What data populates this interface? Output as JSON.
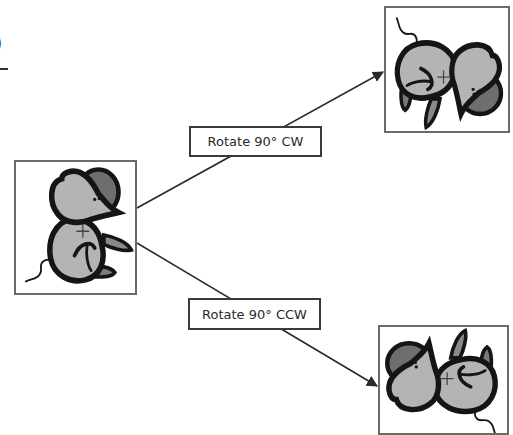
{
  "figure": {
    "type": "rotation-diagram",
    "cropped_fragment": {
      "text": ")",
      "underline": true
    },
    "source": {
      "name": "original-mouse",
      "rotation_deg": 0,
      "center_marker": "+"
    },
    "transforms": [
      {
        "label": "Rotate 90° CW",
        "rotation_deg": 90,
        "result": "mouse-rotated-cw"
      },
      {
        "label": "Rotate 90° CCW",
        "rotation_deg": -90,
        "result": "mouse-rotated-ccw"
      }
    ],
    "colors": {
      "body": "#b4b4b4",
      "ear_dark": "#6e6e6e",
      "outline": "#151515",
      "frame": "#6a6a6a",
      "arrow": "#2a2a2a"
    }
  }
}
